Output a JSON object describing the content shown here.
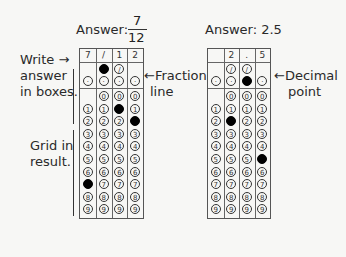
{
  "left_figure": {
    "title_prefix": "Answer:",
    "fraction": {
      "numerator": "7",
      "denominator": "12"
    },
    "boxes": [
      "7",
      "/",
      "1",
      "2"
    ],
    "fraction_line_col": 1,
    "decimal_row_filled": [],
    "slash_cols": [
      1,
      2
    ],
    "digit_filled": {
      "0": 7,
      "2": 1,
      "3": 2
    }
  },
  "right_figure": {
    "title": "Answer: 2.5",
    "boxes": [
      "",
      "2",
      ".",
      "5"
    ],
    "slash_cols": [
      1,
      2
    ],
    "decimal_filled_col": 2,
    "digit_filled": {
      "1": 2,
      "3": 5
    }
  },
  "labels": {
    "write": "Write →",
    "answer": "answer",
    "in_boxes": "in boxes.",
    "fraction": "←Fraction",
    "line": "line",
    "grid_in": "Grid in",
    "result": "result.",
    "decimal": "←Decimal",
    "point": "point"
  },
  "digits": [
    "0",
    "1",
    "2",
    "3",
    "4",
    "5",
    "6",
    "7",
    "8",
    "9"
  ],
  "bubble_glyphs": {
    "slash": "/",
    "dot": "·"
  }
}
